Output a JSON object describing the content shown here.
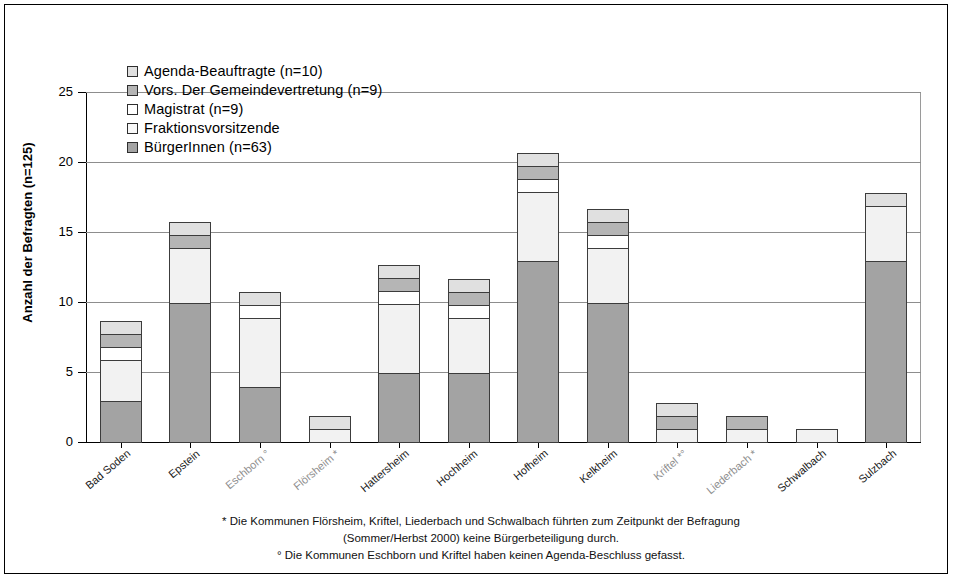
{
  "chart_data": {
    "type": "bar",
    "stacked": true,
    "title": "",
    "xlabel": "",
    "ylabel": "Anzahl der Befragten (n=125)",
    "ylim": [
      0,
      25
    ],
    "yticks": [
      0,
      5,
      10,
      15,
      20,
      25
    ],
    "grid": true,
    "legend_position": "top-left",
    "categories": [
      "Bad Soden",
      "Epstein",
      "Eschborn °",
      "Flörsheim *",
      "Hattersheim",
      "Hochheim",
      "Hofheim",
      "Kelkheim",
      "Kriftel *°",
      "Liederbach *",
      "Schwalbach",
      "Sulzbach"
    ],
    "series": [
      {
        "name": "BürgerInnen (n=63)",
        "color": "#a3a3a3",
        "values": [
          3,
          10,
          4,
          0,
          5,
          5,
          13,
          10,
          0,
          0,
          0,
          13
        ]
      },
      {
        "name": "Fraktionsvorsitzende",
        "color": "#f2f2f2",
        "values": [
          3,
          4,
          5,
          1,
          5,
          4,
          5,
          4,
          1,
          1,
          1,
          4
        ]
      },
      {
        "name": "Magistrat (n=9)",
        "color": "#ffffff",
        "values": [
          1,
          0,
          1,
          0,
          1,
          1,
          1,
          1,
          0,
          0,
          0,
          0
        ]
      },
      {
        "name": "Vors. Der Gemeindevertretung (n=9)",
        "color": "#b5b5b5",
        "values": [
          1,
          1,
          0,
          0,
          1,
          1,
          1,
          1,
          1,
          1,
          0,
          0
        ]
      },
      {
        "name": "Agenda-Beauftragte (n=10)",
        "color": "#e0e0e0",
        "values": [
          1,
          1,
          1,
          1,
          1,
          1,
          1,
          1,
          1,
          0,
          0,
          1
        ]
      }
    ],
    "totals": [
      9,
      16,
      11,
      2,
      13,
      12,
      21,
      17,
      3,
      2,
      1,
      18
    ]
  },
  "legend": {
    "entries": [
      {
        "label": "Agenda-Beauftragte (n=10)",
        "color": "#e0e0e0"
      },
      {
        "label": "Vors. Der Gemeindevertretung (n=9)",
        "color": "#b5b5b5"
      },
      {
        "label": "Magistrat (n=9)",
        "color": "#ffffff"
      },
      {
        "label": "Fraktionsvorsitzende",
        "color": "#f8f8f8"
      },
      {
        "label": "BürgerInnen (n=63)",
        "color": "#a3a3a3"
      }
    ]
  },
  "axis": {
    "y_title": "Anzahl der Befragten (n=125)",
    "y_tick_labels": [
      "25",
      "20",
      "15",
      "10",
      "5",
      "0"
    ]
  },
  "footnotes": {
    "line1": "* Die Kommunen Flörsheim, Kriftel, Liederbach und Schwalbach führten zum Zeitpunkt der Befragung",
    "line2": "(Sommer/Herbst 2000) keine Bürgerbeteiligung durch.",
    "line3": "° Die Kommunen Eschborn und Kriftel haben keinen Agenda-Beschluss gefasst."
  }
}
